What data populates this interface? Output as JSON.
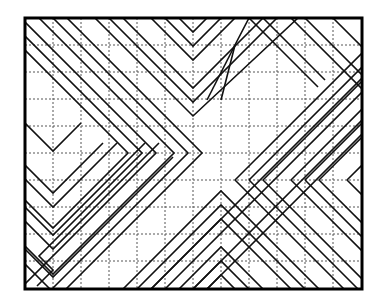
{
  "diagram": {
    "type": "line-pattern",
    "frame": {
      "x": 25,
      "y": 18,
      "width": 337,
      "height": 271,
      "stroke": "#000000"
    },
    "grid": {
      "columns": 12,
      "rows": 10,
      "vertical_lines_x": [
        53,
        81,
        109,
        137,
        165,
        193,
        221,
        249,
        277,
        305,
        333
      ],
      "horizontal_lines_y": [
        45,
        72,
        99,
        126,
        153,
        180,
        207,
        234,
        261
      ],
      "style": "dashed",
      "color": "#555555"
    },
    "fold_axes": {
      "left_chevron_tip_row_y": 153,
      "right_chevron_tip_row_y": 180,
      "top_v_tip_col_x": 193,
      "bottom_peak_col_x": 221,
      "left_v_tip_col_x": 53
    },
    "stripe_color": "#111111",
    "polylines": [
      [
        [
          25,
          22
        ],
        [
          156,
          153
        ],
        [
          25,
          284
        ]
      ],
      [
        [
          25,
          36
        ],
        [
          142,
          153
        ],
        [
          39,
          256
        ],
        [
          53,
          270
        ],
        [
          37,
          286
        ]
      ],
      [
        [
          25,
          50
        ],
        [
          128,
          153
        ],
        [
          53,
          228
        ],
        [
          25,
          200
        ]
      ],
      [
        [
          39,
          18
        ],
        [
          174,
          153
        ],
        [
          53,
          274
        ],
        [
          25,
          246
        ]
      ],
      [
        [
          53,
          18
        ],
        [
          188,
          153
        ],
        [
          53,
          288
        ]
      ],
      [
        [
          67,
          18
        ],
        [
          202,
          153
        ],
        [
          66,
          289
        ]
      ],
      [
        [
          95,
          18
        ],
        [
          193,
          116
        ],
        [
          298,
          18
        ]
      ],
      [
        [
          109,
          18
        ],
        [
          193,
          102
        ],
        [
          277,
          18
        ]
      ],
      [
        [
          123,
          18
        ],
        [
          193,
          88
        ],
        [
          263,
          18
        ]
      ],
      [
        [
          151,
          18
        ],
        [
          193,
          60
        ],
        [
          235,
          18
        ]
      ],
      [
        [
          165,
          18
        ],
        [
          193,
          46
        ],
        [
          221,
          18
        ]
      ],
      [
        [
          179,
          18
        ],
        [
          193,
          32
        ],
        [
          207,
          18
        ]
      ],
      [
        [
          25,
          123
        ],
        [
          53,
          151
        ],
        [
          81,
          123
        ]
      ],
      [
        [
          25,
          165
        ],
        [
          53,
          193
        ],
        [
          103,
          143
        ]
      ],
      [
        [
          25,
          179
        ],
        [
          53,
          207
        ],
        [
          117,
          143
        ]
      ],
      [
        [
          25,
          207
        ],
        [
          53,
          235
        ],
        [
          145,
          143
        ]
      ],
      [
        [
          25,
          221
        ],
        [
          53,
          249
        ],
        [
          159,
          143
        ]
      ],
      [
        [
          25,
          249
        ],
        [
          53,
          277
        ],
        [
          173,
          157
        ]
      ],
      [
        [
          25,
          264
        ],
        [
          50,
          289
        ]
      ],
      [
        [
          207,
          289
        ],
        [
          362,
          134
        ]
      ],
      [
        [
          193,
          289
        ],
        [
          362,
          120
        ]
      ],
      [
        [
          165,
          289
        ],
        [
          362,
          92
        ]
      ],
      [
        [
          151,
          289
        ],
        [
          362,
          78
        ]
      ],
      [
        [
          123,
          289
        ],
        [
          221,
          191
        ],
        [
          319,
          289
        ]
      ],
      [
        [
          137,
          289
        ],
        [
          221,
          205
        ],
        [
          305,
          289
        ]
      ],
      [
        [
          151,
          289
        ],
        [
          221,
          219
        ],
        [
          291,
          289
        ]
      ],
      [
        [
          179,
          289
        ],
        [
          221,
          247
        ],
        [
          263,
          289
        ]
      ],
      [
        [
          193,
          289
        ],
        [
          221,
          261
        ],
        [
          249,
          289
        ]
      ],
      [
        [
          207,
          289
        ],
        [
          221,
          275
        ],
        [
          235,
          289
        ]
      ],
      [
        [
          221,
          100
        ],
        [
          235,
          45
        ],
        [
          249,
          18
        ]
      ],
      [
        [
          207,
          100
        ],
        [
          235,
          45
        ]
      ],
      [
        [
          235,
          180
        ],
        [
          362,
          53
        ]
      ],
      [
        [
          235,
          180
        ],
        [
          344,
          289
        ]
      ],
      [
        [
          249,
          180
        ],
        [
          362,
          67
        ]
      ],
      [
        [
          249,
          180
        ],
        [
          358,
          289
        ]
      ],
      [
        [
          263,
          180
        ],
        [
          362,
          81
        ]
      ],
      [
        [
          263,
          180
        ],
        [
          362,
          279
        ]
      ],
      [
        [
          291,
          180
        ],
        [
          362,
          109
        ]
      ],
      [
        [
          291,
          180
        ],
        [
          362,
          251
        ]
      ],
      [
        [
          305,
          180
        ],
        [
          362,
          123
        ]
      ],
      [
        [
          305,
          180
        ],
        [
          362,
          237
        ]
      ],
      [
        [
          319,
          180
        ],
        [
          362,
          137
        ]
      ],
      [
        [
          319,
          180
        ],
        [
          362,
          223
        ]
      ],
      [
        [
          347,
          180
        ],
        [
          362,
          165
        ]
      ],
      [
        [
          347,
          180
        ],
        [
          362,
          195
        ]
      ],
      [
        [
          333,
          18
        ],
        [
          362,
          47
        ]
      ],
      [
        [
          305,
          18
        ],
        [
          362,
          75
        ]
      ],
      [
        [
          291,
          18
        ],
        [
          362,
          89
        ]
      ],
      [
        [
          263,
          18
        ],
        [
          325,
          80
        ]
      ],
      [
        [
          249,
          18
        ],
        [
          318,
          87
        ]
      ]
    ]
  }
}
